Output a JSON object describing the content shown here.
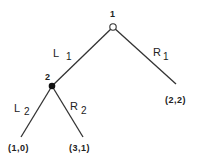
{
  "diagram": {
    "type": "game-tree",
    "nodes": [
      {
        "id": "1",
        "label": "1",
        "player": 1,
        "fill": "open"
      },
      {
        "id": "2",
        "label": "2",
        "player": 2,
        "fill": "filled"
      }
    ],
    "edges": [
      {
        "from": "1",
        "to": "2",
        "action": "L",
        "subscript": "1"
      },
      {
        "from": "1",
        "to": "leaf_22",
        "action": "R",
        "subscript": "1"
      },
      {
        "from": "2",
        "to": "leaf_10",
        "action": "L",
        "subscript": "2"
      },
      {
        "from": "2",
        "to": "leaf_31",
        "action": "R",
        "subscript": "2"
      }
    ],
    "payoffs": {
      "leaf_22": "(2,2)",
      "leaf_10": "(1,0)",
      "leaf_31": "(3,1)"
    },
    "colors": {
      "line": "#333333",
      "node_filled": "#111111",
      "node_open": "#ffffff"
    }
  }
}
